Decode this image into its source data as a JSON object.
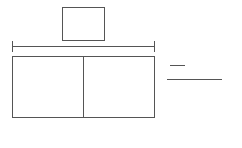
{
  "diagram": {
    "type": "tape-diagram",
    "top_box": {
      "label": ""
    },
    "bracket": {
      "label": ""
    },
    "bar": {
      "parts": [
        {
          "label": ""
        },
        {
          "label": ""
        }
      ]
    },
    "fraction": {
      "numerator": "",
      "denominator": ""
    },
    "stroke_color": "#555555"
  }
}
